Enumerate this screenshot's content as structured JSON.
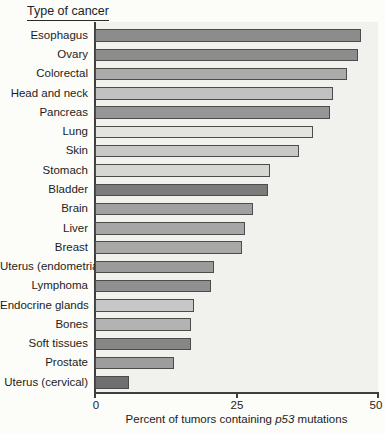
{
  "header": {
    "title": "Type of cancer"
  },
  "axis": {
    "tick_labels": [
      "0",
      "25",
      "50"
    ],
    "title_prefix": "Percent of tumors containing ",
    "title_italic": "p53",
    "title_suffix": " mutations"
  },
  "chart_data": {
    "type": "bar",
    "orientation": "horizontal",
    "title": "Type of cancer",
    "xlabel": "Percent of tumors containing p53 mutations",
    "xlim": [
      0,
      50
    ],
    "xticks": [
      0,
      25,
      50
    ],
    "grid": false,
    "legend": false,
    "categories": [
      "Esophagus",
      "Ovary",
      "Colorectal",
      "Head and neck",
      "Pancreas",
      "Lung",
      "Skin",
      "Stomach",
      "Bladder",
      "Brain",
      "Liver",
      "Breast",
      "Uterus (endometrial)",
      "Lymphoma",
      "Endocrine glands",
      "Bones",
      "Soft tissues",
      "Prostate",
      "Uterus (cervical)"
    ],
    "values": [
      47,
      46.5,
      44.5,
      42,
      41.5,
      38.5,
      36,
      31,
      30.5,
      28,
      26.5,
      26,
      21,
      20.5,
      17.5,
      17,
      17,
      14,
      6
    ],
    "bar_colors": [
      "#8c8c8c",
      "#8c8c8c",
      "#ababab",
      "#c1c1c1",
      "#969696",
      "#e3e3e0",
      "#c9c9c9",
      "#d6d6d3",
      "#7b7b7b",
      "#a0a0a0",
      "#a6a6a6",
      "#a8a8a8",
      "#9b9b9b",
      "#8f8f8f",
      "#c7c7c7",
      "#b3b3b3",
      "#878787",
      "#9d9d9d",
      "#6f6f6f"
    ],
    "bar_border_color": "#4c4c4c",
    "plot_background": "#f1f1ee",
    "axis_color": "#3e3e3e"
  }
}
